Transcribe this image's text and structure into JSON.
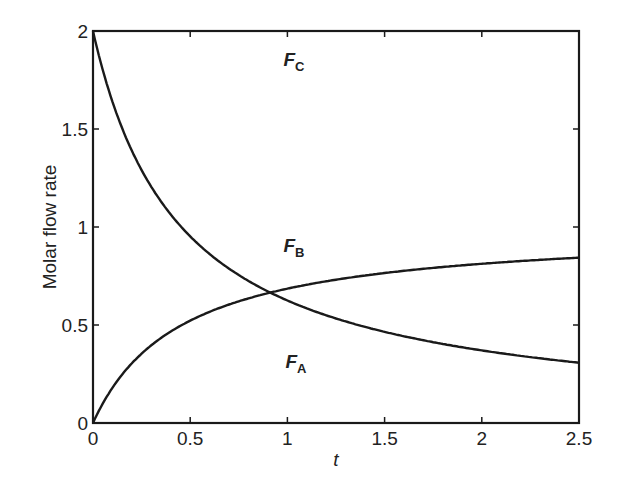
{
  "chart_data": {
    "type": "line",
    "title": "",
    "xlabel": "t",
    "ylabel": "Molar flow rate",
    "xlim": [
      0,
      2.5
    ],
    "ylim": [
      0,
      2
    ],
    "grid": false,
    "legend": "none (inline curve labels)",
    "x_ticks": [
      "0",
      "0.5",
      "1",
      "1.5",
      "2",
      "2.5"
    ],
    "y_ticks": [
      "0",
      "0.5",
      "1",
      "1.5",
      "2"
    ],
    "x": [
      0,
      0.1,
      0.2,
      0.3,
      0.4,
      0.5,
      0.6,
      0.7,
      0.8,
      0.9,
      1.0,
      1.25,
      1.5,
      1.75,
      2.0,
      2.25,
      2.5
    ],
    "series": [
      {
        "name": "F_A",
        "label": "F",
        "subscript": "A",
        "values": [
          2.0,
          1.64,
          1.39,
          1.2,
          1.06,
          0.95,
          0.86,
          0.79,
          0.72,
          0.67,
          0.63,
          0.53,
          0.46,
          0.41,
          0.37,
          0.34,
          0.31
        ]
      },
      {
        "name": "F_B",
        "label": "F",
        "subscript": "B",
        "values": [
          0.0,
          0.18,
          0.31,
          0.4,
          0.47,
          0.53,
          0.57,
          0.61,
          0.64,
          0.67,
          0.69,
          0.74,
          0.77,
          0.8,
          0.82,
          0.84,
          0.85
        ]
      }
    ],
    "annotations": [
      {
        "text": "F",
        "subscript": "C",
        "x": 0.98,
        "y": 1.82
      },
      {
        "text": "F",
        "subscript": "B",
        "x": 0.98,
        "y": 0.87
      },
      {
        "text": "F",
        "subscript": "A",
        "x": 0.99,
        "y": 0.28
      }
    ]
  }
}
